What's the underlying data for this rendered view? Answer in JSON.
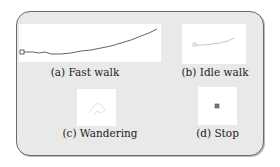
{
  "figure": {
    "panels": [
      {
        "id": "a",
        "caption": "(a) Fast walk"
      },
      {
        "id": "b",
        "caption": "(b) Idle walk"
      },
      {
        "id": "c",
        "caption": "(c) Wandering"
      },
      {
        "id": "d",
        "caption": "(d) Stop"
      }
    ]
  }
}
